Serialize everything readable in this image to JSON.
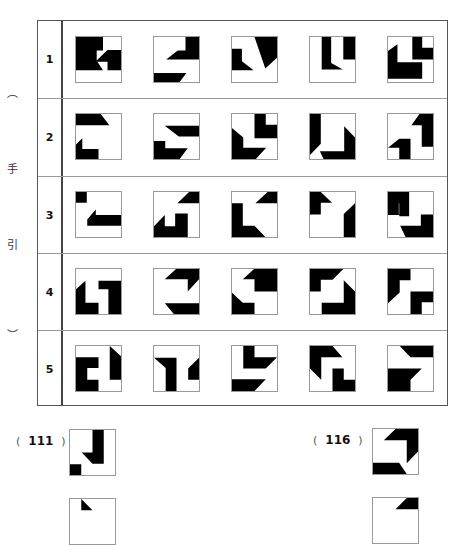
{
  "side_note": [
    "︵",
    "手",
    "引",
    "︶"
  ],
  "table": {
    "rows": [
      {
        "label": "1",
        "tiles": [
          "M0 0H6V3H4.6V5.3L6 7.4H0Z M4.3 5.5L7 2.9H10V7.4H7V5.5Z",
          "M0 8H7.2L5.7 10H0Z M2.7 5L5.3 3H7V0H10V5Z",
          "M0 2.6H2.2V5.4L4.8 7.4H0Z M5 0H10V4.6L7.4 7Z",
          "M2.6 0H4.7V5.8L7.3 7.2H2.6Z M7.4 0H10V5H7.4Z",
          "M0 6.6V3.1L2.1 1.6V5.6H7.6V9.3H0Z M5.4 0H7.6V2.4H10V5H5.4Z"
        ]
      },
      {
        "label": "2",
        "tiles": [
          "M0 0H5.5L7.4 2.5H0Z M0 6.8L1.4 5.4V7.8H5V10H0Z",
          "M2.4 2.6H10V5H5.5Z M0 6H2.5V7.6H7.5L5.7 10H0Z",
          "M5 0H7.5V2.4H10V5.4H5Z M0 3.1L2.5 5.2V7.5H7.6L5.3 10H0Z",
          "M0 0H2.4V6.6L0 9.1Z M7.6 2.7L10 5.2V10H3L2.2 8.3H7.6Z",
          "M5.2 2.5L7 0H10V7.3H7.5V2.5Z M0 7.5L2.5 5.5H5V10H2.5V7.5H0Z"
        ]
      },
      {
        "label": "3",
        "tiles": [
          "M0 0H2.4V2.4H0Z M2.5 6.1L4.4 3.9V5.1H10V7.5H2.5Z",
          "M5.2 2.5L7.8 0H10V2.5Z M0 7.6L2.4 5.1V7.6H4.7V4.8H7.5V10H0Z",
          "M5.2 2.5L7.9 0H10V2.5Z M0 2.5H2.4V7.5H5L7.4 10H0Z",
          "M0 0H2.4L4.9 2.4H2.4V5H0Z M7.5 4.9L10 2.5V10H7.5Z",
          "M0 0H4.7V2.5H2.4V5H4.7V5.1H0Z M0 0H2.4V5H0Z M2.5 5.4V0H4.7V5.4Z M7.3 5H10V10H3.9L2.7 7.5H7.3Z"
        ]
      },
      {
        "label": "4",
        "tiles": [
          "M0 4.5L2.1 2.6V7.5H5V10H0Z M5 2.6L7.2 2.6H10V10H7.2V4.5H5Z",
          "M2.4 2.3L4.9 0H10V2.3L7.5 5V2.3Z M2.4 7.6H10V10H4.4Z",
          "M2.4 2.3L4.9 0H10V5H5V2.3Z M0 5.3L2.4 7.5H5V10H0Z",
          "M0 0H7.4L5 2.4H2.4V5H0Z M7.5 2.5L10 5V10H2.6V7.5H7.5Z",
          "M0 0H5V2.5H2.6V5.2L0 7.6Z M5 5H10V7.4H7.5V10H5Z"
        ]
      },
      {
        "label": "5",
        "tiles": [
          "M0 2.5H5V4.9H2.5V7.5H5V10H0Z M7.5 0L10 2.3V7.5H7.5Z",
          "M0 2.6H5V10H2.6V4.9Z M7.6 5V7.5H10V2.6Z",
          "M2.5 0H5V2.5H10L7.5 5H2.5Z M0 7.4H7.5L5 10H0Z",
          "M0 0H5L7.2 2.5H2.5V5L2.5 7.5L0 5Z M5 5H7.5V7.5H10V10H5Z",
          "M2.6 0H10V2.5H5Z M0 5H7.5L5 7.5V10H0Z"
        ]
      }
    ]
  },
  "questions": [
    {
      "open": "(",
      "number": "111",
      "close": ")",
      "tile": "M5 0H7.5V7.5H5L2.6 5H5Z M0 7.6H2.5V10H0Z"
    },
    {
      "open": "(",
      "number": "116",
      "close": ")",
      "tile": "M2.4 2.5L5 0H10V5L7.5 7.6V2.5Z M0 7.5H5.8L7.5 10H0Z"
    }
  ],
  "partial_tiles": [
    "M2.5 0L5 2.5H2.5Z",
    "M5 2.5L7.5 0H10V2.5Z"
  ]
}
